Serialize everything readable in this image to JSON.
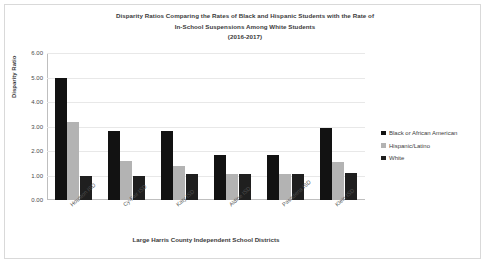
{
  "chart_data": {
    "type": "bar",
    "title": "Disparity Ratios Comparing the Rates of Black and Hispanic Students with the Rate of In-School Suspensions Among White Students (2016-2017)",
    "title_lines": [
      "Disparity Ratios Comparing the Rates of Black and Hispanic Students with the Rate of",
      "In-School Suspensions Among White Students",
      "(2016-2017)"
    ],
    "xlabel": "Large Harris County Independent School Districts",
    "ylabel": "Disparity Ratio",
    "ylim": [
      0,
      6
    ],
    "ytick_labels": [
      "0.00",
      "1.00",
      "2.00",
      "3.00",
      "4.00",
      "5.00",
      "6.00"
    ],
    "ytick_values": [
      0,
      1,
      2,
      3,
      4,
      5,
      6
    ],
    "grid": true,
    "legend_position": "right",
    "categories": [
      "Houston ISD",
      "Cy-Fair ISD",
      "Katy ISD",
      "Aldine ISD",
      "Pasadena ISD",
      "Klein ISD"
    ],
    "series": [
      {
        "name": "Black or African American",
        "color": "#121212",
        "values": [
          5.0,
          2.8,
          2.8,
          1.85,
          1.85,
          2.95
        ]
      },
      {
        "name": "Hispanic/Latino",
        "color": "#b3b3b3",
        "values": [
          3.2,
          1.6,
          1.4,
          1.05,
          1.05,
          1.55
        ]
      },
      {
        "name": "White",
        "color": "#1f1f1f",
        "values": [
          1.0,
          1.0,
          1.05,
          1.05,
          1.05,
          1.1
        ]
      }
    ]
  }
}
